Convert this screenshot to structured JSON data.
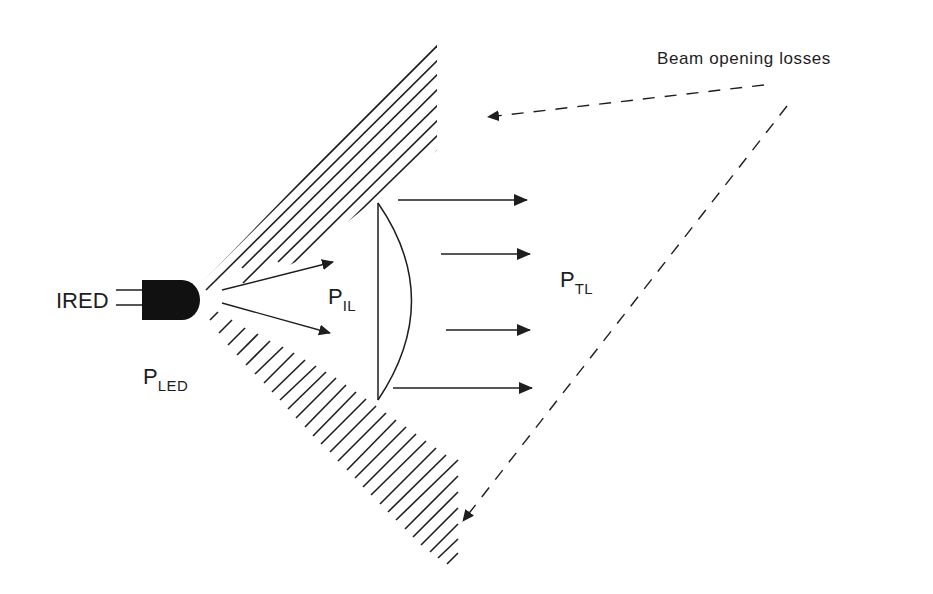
{
  "diagram": {
    "colors": {
      "ink": "#1e1e1e",
      "background": "#ffffff"
    },
    "labels": {
      "source": "IRED",
      "p_led": {
        "main": "P",
        "sub": "LED"
      },
      "p_il": {
        "main": "P",
        "sub": "IL"
      },
      "p_tl": {
        "main": "P",
        "sub": "TL"
      },
      "losses": "Beam opening losses"
    },
    "components": {
      "emitter": "IRED (LED package with two leads)",
      "lens": "plano-convex lens",
      "upper_loss_region": "hatched upper beam cone",
      "lower_loss_region": "hatched lower beam cone"
    },
    "arrows": {
      "diverging_rays": 2,
      "collimated_rays": 4,
      "loss_pointers": 2
    }
  }
}
